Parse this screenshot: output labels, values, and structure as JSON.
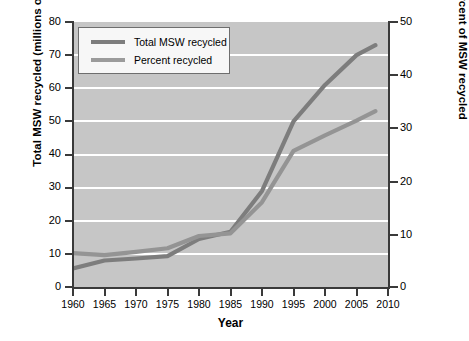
{
  "chart_data": {
    "type": "line",
    "title": "",
    "xlabel": "Year",
    "ylabel": "Total MSW recycled (millions of metric tons)",
    "ylabel_right": "Percent of MSW recycled",
    "xlim": [
      1960,
      2010
    ],
    "ylim": [
      0,
      80
    ],
    "ylim_right": [
      0,
      50
    ],
    "xticks": [
      1960,
      1965,
      1970,
      1975,
      1980,
      1985,
      1990,
      1995,
      2000,
      2005,
      2010
    ],
    "yticks_left": [
      0,
      10,
      20,
      30,
      40,
      50,
      60,
      70,
      80
    ],
    "yticks_right": [
      0,
      10,
      20,
      30,
      40,
      50
    ],
    "grid": "horizontal-white",
    "legend_position": "upper-left-inside",
    "plot_background": "#c6c6c6",
    "series": [
      {
        "name": "Total MSW recycled",
        "axis": "left",
        "units": "millions of metric tons",
        "color": "#7d7d7d",
        "x": [
          1960,
          1965,
          1970,
          1975,
          1980,
          1985,
          1990,
          1995,
          2000,
          2005,
          2008
        ],
        "values": [
          5.6,
          8.0,
          8.6,
          9.3,
          14.5,
          16.7,
          29.0,
          50.0,
          61.0,
          70.0,
          73.0
        ]
      },
      {
        "name": "Percent recycled",
        "axis": "right",
        "units": "percent",
        "color": "#949494",
        "x": [
          1960,
          1965,
          1970,
          1975,
          1980,
          1985,
          1990,
          1995,
          2000,
          2005,
          2008
        ],
        "values": [
          6.4,
          6.0,
          6.6,
          7.3,
          9.6,
          10.1,
          16.0,
          25.7,
          28.6,
          31.4,
          33.2
        ],
        "values_on_left_scale": [
          10.2,
          9.6,
          10.6,
          11.7,
          15.4,
          16.2,
          25.6,
          41.1,
          45.8,
          50.2,
          53.1
        ]
      }
    ]
  },
  "axes": {
    "left_title": "Total MSW recycled (millions of metric tons)",
    "right_title": "Percent of MSW recycled",
    "x_title": "Year",
    "x_ticks": [
      "1960",
      "1965",
      "1970",
      "1975",
      "1980",
      "1985",
      "1990",
      "1995",
      "2000",
      "2005",
      "2010"
    ],
    "y_ticks_left": [
      "80",
      "70",
      "60",
      "50",
      "40",
      "30",
      "20",
      "10",
      "0"
    ],
    "y_ticks_right": [
      "50",
      "40",
      "30",
      "20",
      "10",
      "0"
    ]
  },
  "legend": {
    "items": [
      {
        "label": "Total MSW recycled",
        "color": "#7d7d7d"
      },
      {
        "label": "Percent recycled",
        "color": "#9b9b9b"
      }
    ]
  }
}
